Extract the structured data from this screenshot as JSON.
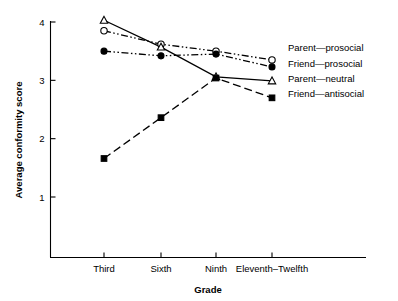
{
  "chart_data": {
    "type": "line",
    "title": "",
    "xlabel": "Grade",
    "ylabel": "Average conformity score",
    "categories": [
      "Third",
      "Sixth",
      "Ninth",
      "Eleventh–Twelfth"
    ],
    "ylim": [
      0,
      4.25
    ],
    "yticks": [
      1,
      2,
      3,
      4
    ],
    "ytick_labels": [
      "1",
      "2",
      "3",
      "4"
    ],
    "grid": false,
    "legend_position": "right",
    "series": [
      {
        "name": "Parent—prosocial",
        "marker": "open-circle",
        "line_style": "dash-dot-dot",
        "color": "#000000",
        "values": [
          3.85,
          3.62,
          3.5,
          3.35
        ]
      },
      {
        "name": "Friend—prosocial",
        "marker": "filled-circle",
        "line_style": "dash-dot-dot",
        "color": "#000000",
        "values": [
          3.5,
          3.42,
          3.45,
          3.23
        ]
      },
      {
        "name": "Parent—neutral",
        "marker": "open-triangle",
        "line_style": "solid",
        "color": "#000000",
        "values": [
          4.03,
          3.57,
          3.06,
          2.99
        ]
      },
      {
        "name": "Friend—antisocial",
        "marker": "filled-square",
        "line_style": "dashed",
        "color": "#000000",
        "values": [
          1.66,
          2.36,
          3.04,
          2.7
        ]
      }
    ]
  }
}
